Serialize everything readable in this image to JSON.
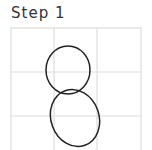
{
  "title": "Step 1",
  "grid": {
    "cols": 3,
    "rows": 3,
    "color": "#dcdcdc"
  },
  "shapes": [
    {
      "type": "circle",
      "name": "upper-circle",
      "cx": 68,
      "cy": 70,
      "rx": 22,
      "ry": 24
    },
    {
      "type": "ellipse",
      "name": "lower-ellipse",
      "cx": 75,
      "cy": 118,
      "rx": 24,
      "ry": 29,
      "rotation": -20
    }
  ],
  "stroke_color": "#222222"
}
